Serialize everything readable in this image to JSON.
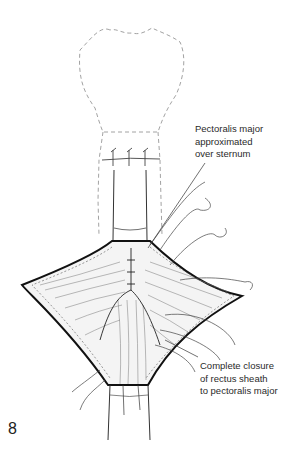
{
  "figure": {
    "number": "8",
    "annotations": [
      {
        "id": "pectoralis",
        "lines": [
          "Pectoralis major",
          "approximated",
          "over sternum"
        ]
      },
      {
        "id": "rectus",
        "lines": [
          "Complete closure",
          "of rectus sheath",
          "to pectoralis major"
        ]
      }
    ]
  },
  "colors": {
    "ink": "#222222",
    "dashed_outline": "#888888",
    "background": "#ffffff"
  }
}
